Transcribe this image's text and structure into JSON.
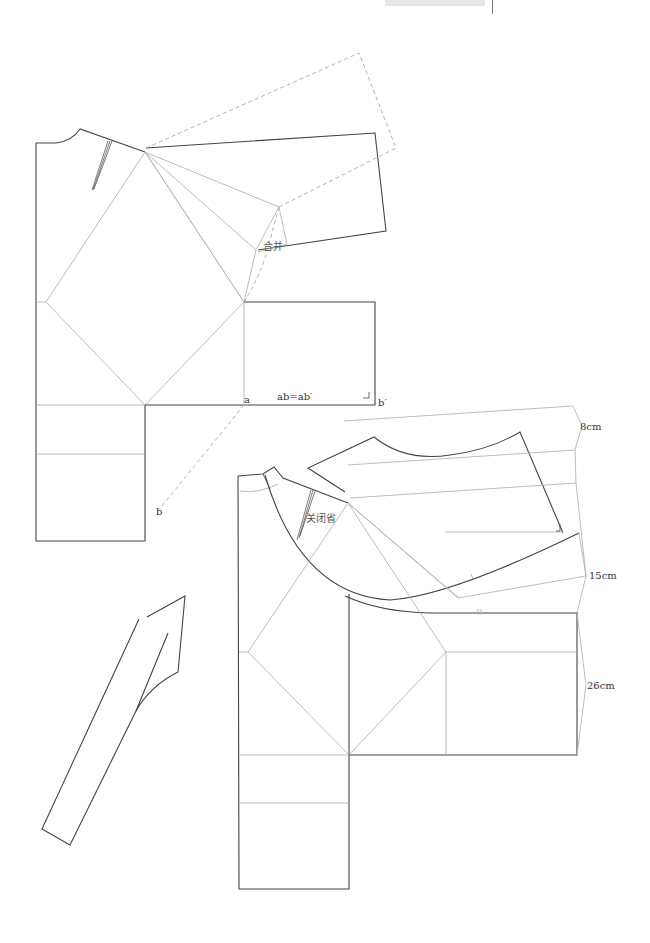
{
  "page": {
    "header_running_title": ""
  },
  "colors": {
    "outline": "#444444",
    "guide": "#b5b5b5",
    "dashed": "#aaaaaa",
    "text": "#333333"
  },
  "labels": {
    "merge": "合并",
    "ab_equals": "ab=ab′",
    "point_a": "a",
    "point_b": "b",
    "point_b_prime": "b′",
    "close_dart": "关闭省",
    "dim_8cm": "8cm",
    "dim_15cm": "15cm",
    "dim_26cm": "26cm"
  },
  "figures": [
    {
      "id": "upper-draft",
      "title": "Bodice with rotated sleeve block (top)"
    },
    {
      "id": "collar-piece",
      "title": "Separate collar/facing piece (bottom-left)"
    },
    {
      "id": "lower-draft",
      "title": "Bodice with curved collar extension (bottom-right)"
    }
  ]
}
